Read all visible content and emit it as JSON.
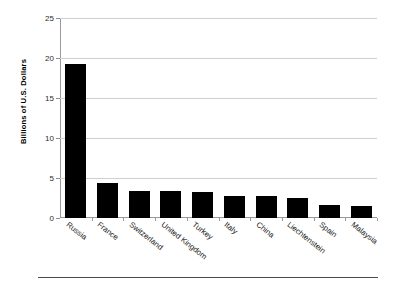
{
  "chart_data": {
    "type": "bar",
    "title": "",
    "xlabel": "",
    "ylabel": "Billions of U.S. Dollars",
    "ylim": [
      0,
      25
    ],
    "ytick_values": [
      0,
      5,
      10,
      15,
      20,
      25
    ],
    "ytick_labels": [
      "0",
      "5",
      "10",
      "15",
      "20",
      "25"
    ],
    "grid": true,
    "legend": "none",
    "bar_color": "#000000",
    "gridline_color": "#cfcfcf",
    "axis_color": "#9a9a9a",
    "categories": [
      "Russia",
      "France",
      "Switzerland",
      "United Kingdom",
      "Turkey",
      "Italy",
      "China",
      "Liechtenstein",
      "Spain",
      "Malaysia"
    ],
    "values": [
      19.3,
      4.4,
      3.4,
      3.4,
      3.3,
      2.8,
      2.7,
      2.5,
      1.6,
      1.5
    ]
  }
}
